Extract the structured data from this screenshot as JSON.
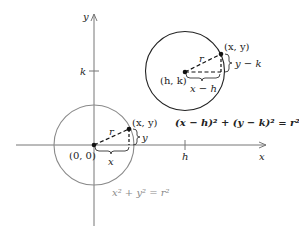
{
  "axes": {
    "x_label": "x",
    "y_label": "y",
    "h_tick_label": "h",
    "k_tick_label": "k"
  },
  "origin_circle": {
    "center_label": "(0, 0)",
    "point_label": "(x, y)",
    "radius_label": "r",
    "horizontal_leg_label": "x",
    "vertical_leg_label": "y",
    "equation": "x² + y² = r²",
    "stroke_color": "#8a8a8a"
  },
  "shifted_circle": {
    "center_label": "(h, k)",
    "point_label": "(x, y)",
    "radius_label": "r",
    "horizontal_leg_label": "x − h",
    "vertical_leg_label": "y − k",
    "equation": "(x − h)² + (y − k)² = r²",
    "stroke_color": "#222222"
  }
}
